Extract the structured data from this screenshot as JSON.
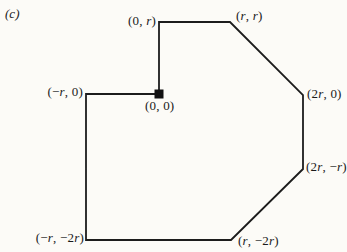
{
  "figure": {
    "panel_label": "(c)",
    "colors": {
      "background": "#fcfbf7",
      "line": "#1c1c1c",
      "marker": "#111111"
    },
    "polygon_px": "159,22 230,22 303,95 303,169 231,240 86,240 86,94 159,94",
    "line_width": 1.8,
    "origin_marker_px": {
      "x": 159,
      "y": 94,
      "size": 9
    },
    "vertex_labels": {
      "top_left": "(0, r)",
      "top_right": "(r, r)",
      "right_upper": "(2r, 0)",
      "right_lower": "(2r, −r)",
      "bottom_right": "(r, −2r)",
      "bottom_left": "(−r, −2r)",
      "left": "(−r, 0)",
      "origin": "(0, 0)"
    }
  }
}
